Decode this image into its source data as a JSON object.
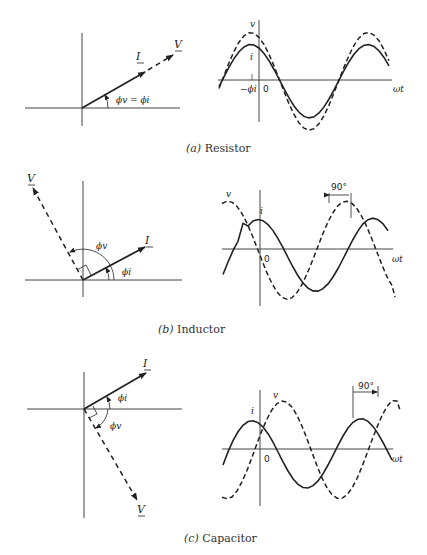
{
  "figures": [
    {
      "id": "a",
      "caption_letter": "(a)",
      "caption_text": " Resistor",
      "phasor": {
        "I_label": "I",
        "V_label": "V",
        "angle_label": "ϕv = ϕi",
        "I_angle_deg": 30,
        "V_angle_deg": 30
      },
      "waveform": {
        "v_label": "v",
        "i_label": "i",
        "origin_label": "0",
        "phase_label": "−ϕi",
        "axis_label": "ωt",
        "phase_shift": "0°"
      }
    },
    {
      "id": "b",
      "caption_letter": "(b)",
      "caption_text": " Inductor",
      "phasor": {
        "I_label": "I",
        "V_label": "V",
        "phi_v_label": "ϕv",
        "phi_i_label": "ϕi",
        "I_angle_deg": 27,
        "V_angle_deg": 117
      },
      "waveform": {
        "v_label": "v",
        "i_label": "i",
        "origin_label": "0",
        "axis_label": "ωt",
        "shift_label": "90°",
        "relation": "v leads i by 90°"
      }
    },
    {
      "id": "c",
      "caption_letter": "(c)",
      "caption_text": " Capacitor",
      "phasor": {
        "I_label": "I",
        "V_label": "V",
        "phi_v_label": "ϕv",
        "phi_i_label": "ϕi",
        "I_angle_deg": 27,
        "V_angle_deg": -63
      },
      "waveform": {
        "v_label": "v",
        "i_label": "i",
        "origin_label": "0",
        "axis_label": "ωt",
        "shift_label": "90°",
        "relation": "v lags i by 90°"
      }
    }
  ]
}
